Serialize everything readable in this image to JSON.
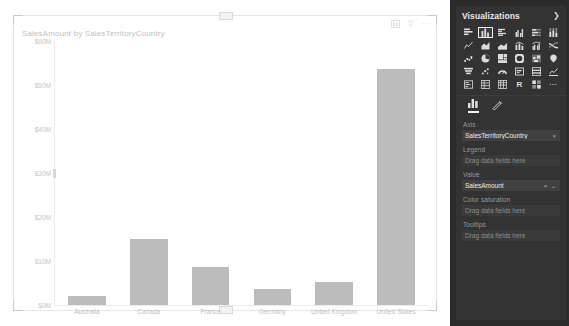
{
  "chart_data": {
    "type": "bar",
    "title": "SalesAmount by SalesTerritoryCountry",
    "xlabel": "",
    "ylabel": "",
    "categories": [
      "Australia",
      "Canada",
      "France",
      "Germany",
      "United Kingdom",
      "United States"
    ],
    "values": [
      2.0,
      14.9,
      8.6,
      3.7,
      5.2,
      53.6
    ],
    "value_unit": "M",
    "ylim": [
      0,
      60
    ],
    "yticks": [
      "$60M",
      "$50M",
      "$40M",
      "$30M",
      "$20M",
      "$10M",
      "$0M"
    ],
    "ytick_values": [
      60,
      50,
      40,
      30,
      20,
      10,
      0
    ],
    "grid": false,
    "legend": "none",
    "bar_color": "#bcbcbc",
    "axis_text_color": "#c0c0c0"
  },
  "visual": {
    "header_icons": [
      "focus-mode-icon",
      "filter-icon",
      "more-options-icon"
    ],
    "resize_handle": "resize-handle"
  },
  "viz_pane": {
    "title": "Visualizations",
    "collapse_icon": "chevron-right-icon",
    "gallery_icons": [
      "stacked-bar-chart-icon",
      "stacked-column-chart-icon",
      "clustered-bar-chart-icon",
      "clustered-column-chart-icon",
      "hundred-percent-stacked-bar-icon",
      "hundred-percent-stacked-column-icon",
      "line-chart-icon",
      "area-chart-icon",
      "stacked-area-chart-icon",
      "line-stacked-column-icon",
      "line-clustered-column-icon",
      "ribbon-chart-icon",
      "waterfall-chart-icon",
      "pie-chart-icon",
      "treemap-icon",
      "donut-chart-icon",
      "map-icon",
      "filled-map-icon",
      "funnel-chart-icon",
      "scatter-chart-icon",
      "gauge-icon",
      "card-icon",
      "multi-row-card-icon",
      "kpi-icon",
      "slicer-icon",
      "table-icon",
      "matrix-icon",
      "r-script-visual-icon",
      "python-visual-icon",
      "more-visuals-icon"
    ],
    "selected_gallery_icon_index": 1,
    "tabs": [
      {
        "name": "fields-tab",
        "icon": "bar-chart-icon",
        "active": true
      },
      {
        "name": "format-tab",
        "icon": "paint-roller-icon",
        "active": false
      }
    ],
    "wells": [
      {
        "label": "Axis",
        "value": "SalesTerritoryCountry",
        "placeholder": "",
        "actions": "×"
      },
      {
        "label": "Legend",
        "value": "",
        "placeholder": "Drag data fields here",
        "actions": ""
      },
      {
        "label": "Value",
        "value": "SalesAmount",
        "placeholder": "",
        "actions": "× ⌄"
      },
      {
        "label": "Color saturation",
        "value": "",
        "placeholder": "Drag data fields here",
        "actions": ""
      },
      {
        "label": "Tooltips",
        "value": "",
        "placeholder": "Drag data fields here",
        "actions": ""
      }
    ]
  }
}
